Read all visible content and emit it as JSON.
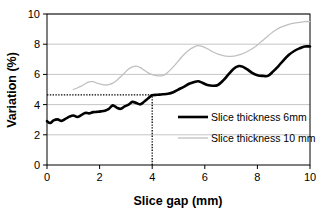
{
  "chart_data": {
    "type": "line",
    "title": "",
    "xlabel": "Slice gap (mm)",
    "ylabel": "Variation (%)",
    "xlim": [
      0,
      10
    ],
    "ylim": [
      0,
      10
    ],
    "xticks": [
      "0",
      "2",
      "4",
      "6",
      "8",
      "10"
    ],
    "xtick_values": [
      0,
      2,
      4,
      6,
      8,
      10
    ],
    "yticks": [
      "0",
      "2",
      "4",
      "6",
      "8",
      "10"
    ],
    "ytick_values": [
      0,
      2,
      4,
      6,
      8,
      10
    ],
    "grid": "horizontal",
    "legend_position": "inside-lower-right",
    "series": [
      {
        "name": "Slice thickness 6mm",
        "color": "#000000",
        "width": 2.6,
        "x": [
          0.0,
          0.12,
          0.25,
          0.4,
          0.55,
          0.7,
          0.85,
          1.0,
          1.15,
          1.3,
          1.45,
          1.6,
          1.75,
          1.9,
          2.05,
          2.2,
          2.35,
          2.5,
          2.65,
          2.8,
          2.95,
          3.1,
          3.25,
          3.4,
          3.55,
          3.7,
          3.85,
          4.0,
          4.2,
          4.4,
          4.6,
          4.8,
          5.0,
          5.2,
          5.4,
          5.6,
          5.75,
          5.9,
          6.1,
          6.3,
          6.5,
          6.7,
          6.9,
          7.1,
          7.3,
          7.45,
          7.6,
          7.8,
          8.0,
          8.2,
          8.4,
          8.6,
          8.8,
          9.0,
          9.2,
          9.4,
          9.6,
          9.8,
          10.0
        ],
        "y": [
          2.9,
          2.78,
          2.95,
          3.02,
          2.92,
          3.05,
          3.2,
          3.28,
          3.18,
          3.3,
          3.45,
          3.42,
          3.5,
          3.52,
          3.55,
          3.6,
          3.72,
          3.95,
          3.8,
          3.72,
          3.88,
          4.0,
          4.18,
          4.1,
          4.02,
          4.2,
          4.42,
          4.62,
          4.65,
          4.68,
          4.72,
          4.82,
          5.0,
          5.18,
          5.38,
          5.5,
          5.55,
          5.45,
          5.3,
          5.25,
          5.3,
          5.6,
          6.0,
          6.38,
          6.55,
          6.5,
          6.35,
          6.1,
          5.95,
          5.9,
          5.9,
          6.2,
          6.55,
          6.95,
          7.3,
          7.55,
          7.72,
          7.85,
          7.85
        ]
      },
      {
        "name": "Slice thickness 10 mm",
        "color": "#c0c0c0",
        "width": 1.3,
        "x": [
          1.0,
          1.15,
          1.3,
          1.45,
          1.6,
          1.75,
          1.9,
          2.05,
          2.2,
          2.35,
          2.5,
          2.65,
          2.8,
          2.95,
          3.1,
          3.25,
          3.4,
          3.55,
          3.7,
          3.85,
          4.0,
          4.15,
          4.3,
          4.45,
          4.6,
          4.8,
          5.0,
          5.2,
          5.4,
          5.6,
          5.75,
          5.9,
          6.1,
          6.3,
          6.5,
          6.7,
          6.9,
          7.0,
          7.2,
          7.4,
          7.6,
          7.8,
          8.0,
          8.2,
          8.4,
          8.6,
          8.8,
          9.0,
          9.2,
          9.4,
          9.6,
          9.8,
          10.0
        ],
        "y": [
          5.0,
          5.1,
          5.22,
          5.38,
          5.5,
          5.52,
          5.42,
          5.35,
          5.3,
          5.32,
          5.42,
          5.6,
          5.85,
          6.1,
          6.35,
          6.5,
          6.55,
          6.45,
          6.28,
          6.1,
          5.98,
          5.92,
          5.9,
          5.95,
          6.15,
          6.5,
          6.9,
          7.3,
          7.62,
          7.82,
          7.9,
          7.85,
          7.7,
          7.5,
          7.35,
          7.25,
          7.2,
          7.2,
          7.25,
          7.35,
          7.5,
          7.7,
          7.95,
          8.25,
          8.55,
          8.82,
          9.05,
          9.2,
          9.32,
          9.4,
          9.45,
          9.5,
          9.5
        ]
      }
    ],
    "annotations": [
      {
        "name": "reference-horizontal",
        "type": "hline",
        "y": 4.65,
        "x_from": 0,
        "x_to": 4.0,
        "style": "dotted",
        "color": "#000000"
      },
      {
        "name": "reference-vertical",
        "type": "vline",
        "x": 4.0,
        "y_from": 0,
        "y_to": 4.65,
        "style": "dotted",
        "color": "#000000"
      }
    ],
    "colors": {
      "axis": "#000000",
      "grid": "#bfbfbf",
      "series_6mm": "#000000",
      "series_10mm": "#c0c0c0",
      "background": "#ffffff"
    }
  },
  "legend": {
    "items": [
      {
        "label": "Slice thickness 6mm",
        "color": "#000000"
      },
      {
        "label": "Slice thickness 10 mm",
        "color": "#c0c0c0"
      }
    ]
  },
  "axes": {
    "x_title": "Slice gap (mm)",
    "y_title": "Variation (%)"
  }
}
